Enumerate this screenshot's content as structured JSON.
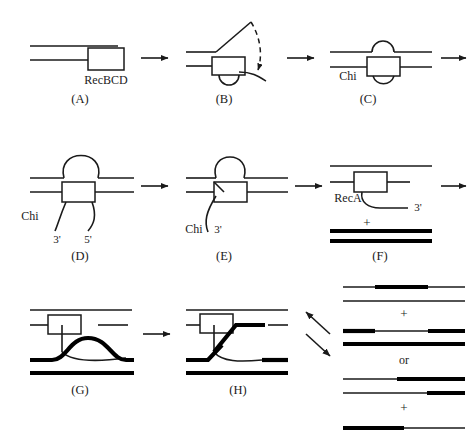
{
  "figure": {
    "background_color": "#ffffff",
    "line_color": "#1a1a1a"
  },
  "panels": [
    {
      "id": "A",
      "label": "(A)",
      "enzyme_label": "RecBCD",
      "description": "Linear duplex DNA with RecBCD enzyme bound at the blunt end"
    },
    {
      "id": "B",
      "label": "(B)",
      "description": "RecBCD unwinds DNA; top strand peels away, dashed arrow shows strand movement"
    },
    {
      "id": "C",
      "label": "(C)",
      "site_label": "Chi",
      "description": "Twin loops form above and below the enzyme as unwinding proceeds"
    },
    {
      "id": "D",
      "label": "(D)",
      "site_label": "Chi",
      "end_labels": [
        "3'",
        "5'"
      ],
      "description": "Large single-strand loop with free 3-prime and 5-prime tails"
    },
    {
      "id": "E",
      "label": "(E)",
      "site_label": "Chi",
      "end_labels": [
        "3'"
      ],
      "description": "After Chi recognition only the 3-prime single-strand tail remains"
    },
    {
      "id": "F",
      "label": "(F)",
      "enzyme_label": "RecA",
      "end_labels": [
        "3'"
      ],
      "plus_sign": "+",
      "description": "RecA coats the 3-prime tail; a homologous duplex partner is added"
    },
    {
      "id": "G",
      "label": "(G)",
      "description": "Strand invasion creates a displacement loop in the recipient duplex"
    },
    {
      "id": "H",
      "label": "(H)",
      "description": "Strand exchange completed, forming a crossed-strand junction"
    }
  ],
  "outcomes": {
    "separator_word": "or",
    "plus_sign": "+",
    "groups": [
      {
        "name": "patch-products",
        "molecules": [
          "thin strand with internal thick patch",
          "plain thin strand"
        ]
      },
      {
        "name": "patch-products-partner",
        "molecules": [
          "thick ends with thin middle segment",
          "fully thick strand"
        ]
      },
      {
        "name": "crossover-products",
        "molecules": [
          "thin left half joined to thick right half",
          "thin strand with thick right end"
        ]
      },
      {
        "name": "crossover-products-partner",
        "molecules": [
          "thick left half joined to thin right half"
        ]
      }
    ]
  },
  "icons": {
    "step_arrow": "right-arrow-icon",
    "branch_arrow_up": "branch-arrow-up-icon",
    "branch_arrow_down": "branch-arrow-down-icon",
    "dashed_arrow": "dashed-curved-arrow-icon"
  }
}
